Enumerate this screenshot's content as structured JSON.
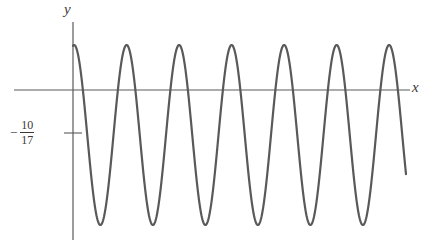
{
  "figure": {
    "background": "#ffffff",
    "curve_color": "#595959",
    "axis_color": "#5a5a5a",
    "text_color": "#3a3a3a"
  },
  "labels": {
    "y_axis": "y",
    "x_axis": "x",
    "y_intercept_minus": "−",
    "y_intercept_numerator": "10",
    "y_intercept_denominator": "17"
  },
  "chart_data": {
    "type": "line",
    "title": "",
    "xlabel": "x",
    "ylabel": "y",
    "legend": "none",
    "grid": false,
    "axes": {
      "x_axis_pixel_y": 90,
      "y_axis_pixel_x": 73,
      "x_axis_drawn_from_px": 14,
      "x_axis_drawn_to_px": 410,
      "y_axis_drawn_from_px": 22,
      "y_axis_drawn_to_px": 240
    },
    "y_tick": {
      "label": "-10/17",
      "value": -0.5882,
      "pixel_y": 133,
      "tick_half_width_px": 9
    },
    "curve": {
      "description": "rapidly oscillating sinusoid, 7 full oscillations shown, starting at y = -10/17 on the y-axis",
      "amplitude_pixels": 90,
      "period_pixels": 52.5,
      "peak_pixel_y": 45,
      "trough_pixel_y": 225,
      "midline_pixel_y": 135,
      "start_pixel_x": 73,
      "end_pixel_x": 406,
      "start_value": -0.5882,
      "phase_offset_px": 12,
      "peaks_pixel_x": [
        85,
        137,
        190,
        242,
        295,
        347,
        400
      ],
      "troughs_pixel_x": [
        111,
        163,
        216,
        268,
        321,
        373
      ],
      "stroke_width": 2.2
    },
    "x": [],
    "y": [],
    "xlim": [
      0,
      422
    ],
    "ylim": [
      244,
      0
    ]
  }
}
